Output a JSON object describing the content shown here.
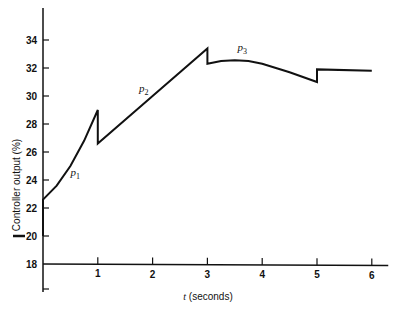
{
  "chart_data": {
    "type": "line",
    "title": "",
    "xlabel_var": "t",
    "xlabel_unit": "(seconds)",
    "ylabel": "Controller output (%)",
    "xlim": [
      0,
      6.3
    ],
    "ylim": [
      16,
      36
    ],
    "x_ticks": [
      "1",
      "2",
      "3",
      "4",
      "5",
      "6"
    ],
    "y_ticks": [
      "34",
      "32",
      "30",
      "28",
      "26",
      "24",
      "22",
      "20",
      "18"
    ],
    "grid": false,
    "annotations": [
      {
        "text": "p",
        "sub": "1",
        "x": 0.5,
        "y": 24.3
      },
      {
        "text": "p",
        "sub": "2",
        "x": 1.75,
        "y": 30.3
      },
      {
        "text": "p",
        "sub": "3",
        "x": 3.55,
        "y": 33.2
      }
    ],
    "series": [
      {
        "name": "Controller output",
        "x": [
          0,
          0,
          0.25,
          0.5,
          0.75,
          1.0,
          1.0,
          2.0,
          3.0,
          3.0,
          3.25,
          3.5,
          3.75,
          4.0,
          4.5,
          5.0,
          5.0,
          6.0
        ],
        "y": [
          20,
          22.6,
          23.6,
          25.0,
          26.8,
          29.0,
          26.6,
          30.0,
          33.4,
          32.3,
          32.5,
          32.55,
          32.5,
          32.3,
          31.7,
          31.0,
          31.9,
          31.8
        ]
      }
    ],
    "reference_marker": {
      "y": 20,
      "label": "—"
    }
  }
}
